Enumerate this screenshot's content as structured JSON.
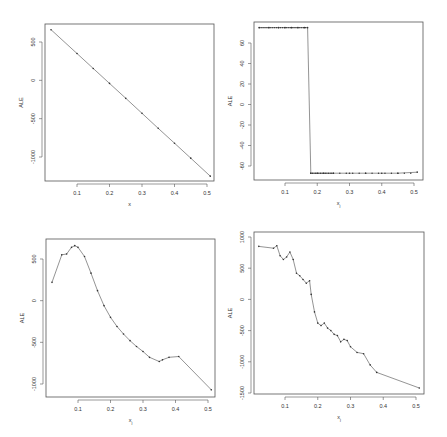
{
  "chart_data": [
    {
      "id": "top-left",
      "type": "line",
      "title": "",
      "xlabel": "x",
      "ylabel": "ALE",
      "xlim": [
        0.0,
        0.52
      ],
      "ylim": [
        -1300,
        720
      ],
      "xticks": [
        0.1,
        0.2,
        0.3,
        0.4,
        0.5
      ],
      "xtick_labels": [
        "0.1",
        "0.2",
        "0.3",
        "0.4",
        "0.5"
      ],
      "yticks": [
        500,
        0,
        -500,
        -1000
      ],
      "ytick_labels": [
        "500",
        "0",
        "-500",
        "-1000"
      ],
      "grid": false,
      "x": [
        0.02,
        0.1,
        0.15,
        0.2,
        0.25,
        0.3,
        0.35,
        0.4,
        0.45,
        0.51
      ],
      "y": [
        660,
        350,
        155,
        -40,
        -235,
        -430,
        -625,
        -820,
        -1015,
        -1250
      ]
    },
    {
      "id": "top-right",
      "type": "line",
      "title": "",
      "xlabel": "x_j",
      "ylabel": "ALE",
      "xlim": [
        0.0,
        0.53
      ],
      "ylim": [
        -73,
        80
      ],
      "xticks": [
        0.1,
        0.2,
        0.3,
        0.4,
        0.5
      ],
      "xtick_labels": [
        "0.1",
        "0.2",
        "0.3",
        "0.4",
        "0.5"
      ],
      "yticks": [
        60,
        40,
        20,
        0,
        -20,
        -40,
        -60
      ],
      "ytick_labels": [
        "60",
        "40",
        "20",
        "0",
        "-20",
        "-40",
        "-60"
      ],
      "grid": false,
      "x": [
        0.02,
        0.05,
        0.08,
        0.1,
        0.12,
        0.14,
        0.16,
        0.17,
        0.18,
        0.2,
        0.22,
        0.25,
        0.3,
        0.35,
        0.4,
        0.45,
        0.51
      ],
      "y": [
        75,
        75,
        75,
        75,
        75,
        75,
        75,
        75,
        -67,
        -67,
        -67,
        -67,
        -67,
        -67,
        -67,
        -67,
        -66
      ]
    },
    {
      "id": "bottom-left",
      "type": "line",
      "title": "",
      "xlabel": "x_j",
      "ylabel": "ALE",
      "xlim": [
        0.0,
        0.52
      ],
      "ylim": [
        -1150,
        690
      ],
      "xticks": [
        0.1,
        0.2,
        0.3,
        0.4,
        0.5
      ],
      "xtick_labels": [
        "0.1",
        "0.2",
        "0.3",
        "0.4",
        "0.5"
      ],
      "yticks": [
        500,
        0,
        -500,
        -1000
      ],
      "ytick_labels": [
        "500",
        "0",
        "-500",
        "-1000"
      ],
      "grid": false,
      "x": [
        0.02,
        0.05,
        0.065,
        0.08,
        0.09,
        0.1,
        0.12,
        0.14,
        0.16,
        0.18,
        0.2,
        0.22,
        0.24,
        0.26,
        0.28,
        0.3,
        0.32,
        0.35,
        0.36,
        0.38,
        0.41,
        0.51
      ],
      "y": [
        220,
        550,
        560,
        640,
        660,
        640,
        530,
        330,
        120,
        -60,
        -200,
        -310,
        -400,
        -480,
        -550,
        -610,
        -680,
        -730,
        -710,
        -680,
        -670,
        -1070
      ]
    },
    {
      "id": "bottom-right",
      "type": "line",
      "title": "",
      "xlabel": "x_j",
      "ylabel": "ALE",
      "xlim": [
        0.0,
        0.53
      ],
      "ylim": [
        -1510,
        1080
      ],
      "xticks": [
        0.1,
        0.2,
        0.3,
        0.4,
        0.5
      ],
      "xtick_labels": [
        "0.1",
        "0.2",
        "0.3",
        "0.4",
        "0.5"
      ],
      "yticks": [
        1000,
        500,
        0,
        -500,
        -1000,
        -1500
      ],
      "ytick_labels": [
        "1000",
        "500",
        "0",
        "-500",
        "-1000",
        "-1500"
      ],
      "grid": false,
      "x": [
        0.02,
        0.065,
        0.075,
        0.085,
        0.095,
        0.105,
        0.115,
        0.125,
        0.135,
        0.145,
        0.155,
        0.165,
        0.175,
        0.18,
        0.19,
        0.2,
        0.21,
        0.22,
        0.23,
        0.24,
        0.25,
        0.26,
        0.27,
        0.28,
        0.29,
        0.3,
        0.32,
        0.34,
        0.36,
        0.38,
        0.51
      ],
      "y": [
        850,
        820,
        860,
        700,
        640,
        680,
        760,
        640,
        420,
        380,
        320,
        260,
        300,
        80,
        -200,
        -380,
        -420,
        -380,
        -460,
        -500,
        -560,
        -580,
        -680,
        -640,
        -660,
        -760,
        -850,
        -870,
        -1050,
        -1170,
        -1420
      ]
    }
  ]
}
